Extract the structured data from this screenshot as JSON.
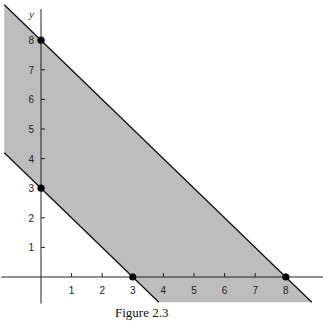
{
  "chart_data": {
    "type": "area",
    "title": "",
    "caption": "Figure 2.3",
    "xlabel": "x",
    "ylabel": "y",
    "x_ticks": [
      1,
      2,
      3,
      4,
      5,
      6,
      7,
      8
    ],
    "y_ticks": [
      1,
      2,
      3,
      4,
      5,
      6,
      7,
      8
    ],
    "xlim": [
      -1.3,
      9.3
    ],
    "ylim": [
      -0.9,
      9.2
    ],
    "grid": false,
    "lines": [
      {
        "name": "x + y = 3",
        "points": [
          [
            0,
            3
          ],
          [
            3,
            0
          ]
        ]
      },
      {
        "name": "x + y = 8",
        "points": [
          [
            0,
            8
          ],
          [
            8,
            0
          ]
        ]
      }
    ],
    "shaded_region": "3 <= x + y <= 8",
    "shade_color": "#bdbdbd",
    "marked_points": [
      [
        0,
        8
      ],
      [
        0,
        3
      ],
      [
        3,
        0
      ],
      [
        8,
        0
      ]
    ]
  },
  "caption": "Figure 2.3"
}
